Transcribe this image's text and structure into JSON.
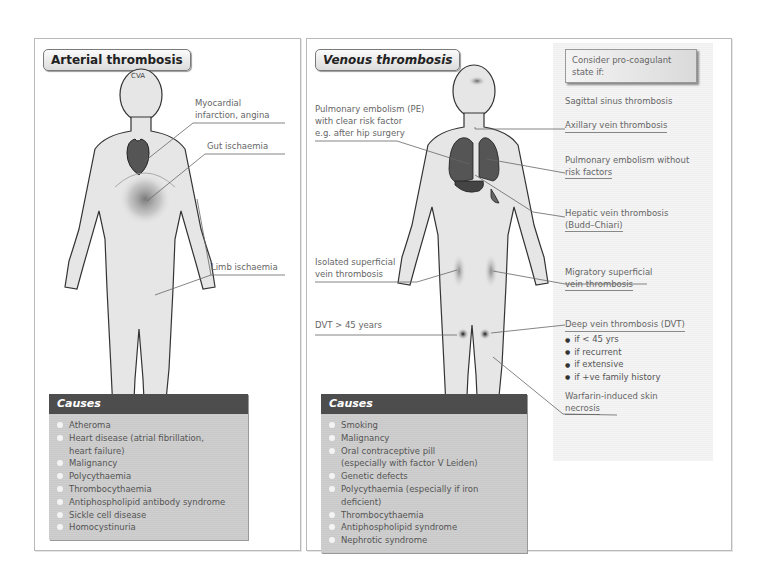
{
  "arterial": {
    "title": "Arterial thrombosis",
    "figure_labels": {
      "cva": "CVA",
      "mi_line1": "Myocardial",
      "mi_line2": "infarction, angina",
      "gut": "Gut ischaemia",
      "limb": "Limb ischaemia"
    },
    "causes_title": "Causes",
    "causes": [
      "Atheroma",
      "Heart disease (atrial fibrillation,",
      "Malignancy",
      "Polycythaemia",
      "Thrombocythaemia",
      "Antiphospholipid antibody syndrome",
      "Sickle cell disease",
      "Homocystinuria"
    ],
    "causes_continuation": "heart failure)"
  },
  "venous": {
    "title": "Venous thrombosis",
    "figure_labels": {
      "pe_line1": "Pulmonary embolism (PE)",
      "pe_line2": "with clear risk factor",
      "pe_line3": "e.g. after hip surgery",
      "superficial_line1": "Isolated superficial",
      "superficial_line2": "vein thrombosis",
      "dvt45": "DVT > 45 years"
    },
    "procoagulant": {
      "heading_line1": "Consider pro-coagulant",
      "heading_line2": "state if:",
      "items": {
        "sagittal": "Sagittal sinus thrombosis",
        "axillary": "Axillary vein thrombosis",
        "pe_no_risk_1": "Pulmonary embolism without",
        "pe_no_risk_2": "risk factors",
        "hepatic_1": "Hepatic vein thrombosis",
        "hepatic_2": "(Budd–Chiari)",
        "migratory_1": "Migratory superficial",
        "migratory_2": "vein thrombosis",
        "dvt": "Deep vein thrombosis (DVT)",
        "warfarin_1": "Warfarin-induced skin",
        "warfarin_2": "necrosis"
      },
      "dvt_bullets": [
        "if < 45 yrs",
        "if recurrent",
        "if extensive",
        "if +ve family history"
      ]
    },
    "causes_title": "Causes",
    "causes": [
      "Smoking",
      "Malignancy",
      "Oral contraceptive pill",
      "Genetic defects",
      "Polycythaemia (especially if iron deficient)",
      "Thrombocythaemia",
      "Antiphospholipid syndrome",
      "Nephrotic syndrome"
    ],
    "causes_continuation": "(especially with factor V Leiden)"
  },
  "colors": {
    "panel_border": "#b9b9b9",
    "causes_header": "#4d4d4d",
    "causes_list_bg": "#cccccc",
    "body_fill": "#e6e6e6",
    "organ_fill": "#555555",
    "sidebar_bg": "#f2f2f2"
  }
}
